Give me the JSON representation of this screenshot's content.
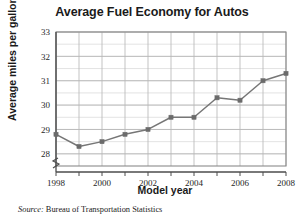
{
  "figure": {
    "title": "Average Fuel Economy for Autos",
    "source_prefix": "Source:",
    "source_text": "Bureau of Transportation Statistics",
    "colors": {
      "line": "#767676",
      "marker": "#6b6b6b",
      "grid_major": "#b8b8b8",
      "grid_minor": "#dcdcdc",
      "frame": "#8a8a8a",
      "text": "#1a1a1a"
    }
  },
  "chart_data": {
    "type": "line",
    "title": "Average Fuel Economy for Autos",
    "xlabel": "Model year",
    "ylabel": "Average miles per gallon",
    "x": [
      1998,
      1999,
      2000,
      2001,
      2002,
      2003,
      2004,
      2005,
      2006,
      2007,
      2008
    ],
    "values": [
      28.8,
      28.3,
      28.5,
      28.8,
      29.0,
      29.5,
      29.5,
      30.3,
      30.2,
      31.0,
      31.3
    ],
    "series": [
      {
        "name": "Average miles per gallon",
        "values": [
          28.8,
          28.3,
          28.5,
          28.8,
          29.0,
          29.5,
          29.5,
          30.3,
          30.2,
          31.0,
          31.3
        ]
      }
    ],
    "xlim": [
      1998,
      2008
    ],
    "ylim": [
      27.5,
      33
    ],
    "ytick_labels": [
      "28",
      "29",
      "30",
      "31",
      "32",
      "33"
    ],
    "yticks": [
      28,
      29,
      30,
      31,
      32,
      33
    ],
    "y_minor_step": 0.5,
    "xtick_labels": [
      "1998",
      "2000",
      "2002",
      "2004",
      "2006",
      "2008"
    ],
    "xticks": [
      1998,
      2000,
      2002,
      2004,
      2006,
      2008
    ],
    "x_minor_step": 1,
    "grid": true,
    "legend": false,
    "axis_break": "y-axis break below 28",
    "marker": "square"
  }
}
